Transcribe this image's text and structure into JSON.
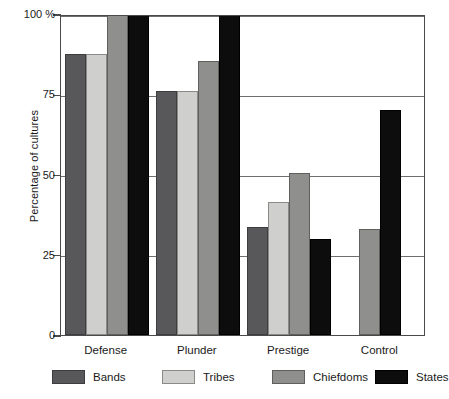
{
  "chart_data": {
    "type": "bar",
    "title": "",
    "xlabel": "",
    "ylabel": "Percentage of cultures",
    "ylim": [
      0,
      100
    ],
    "yticks": [
      0,
      25,
      50,
      75,
      100
    ],
    "ytick_labels": [
      "0",
      "25",
      "50",
      "75",
      "100 %"
    ],
    "grid": true,
    "grid_axis": "y",
    "legend_position": "bottom",
    "categories": [
      "Defense",
      "Plunder",
      "Prestige",
      "Control"
    ],
    "series": [
      {
        "name": "Bands",
        "color": "#58585a",
        "values": [
          87.5,
          76.0,
          33.5,
          null
        ]
      },
      {
        "name": "Tribes",
        "color": "#cfcfcd",
        "values": [
          87.5,
          76.0,
          41.5,
          null
        ]
      },
      {
        "name": "Chiefdoms",
        "color": "#8f8f8d",
        "values": [
          100.0,
          85.5,
          50.5,
          33.0
        ]
      },
      {
        "name": "States",
        "color": "#0d0d0d",
        "values": [
          100.0,
          100.0,
          30.0,
          70.0
        ]
      }
    ]
  },
  "legend": {
    "items": [
      {
        "label": "Bands"
      },
      {
        "label": "Tribes"
      },
      {
        "label": "Chiefdoms"
      },
      {
        "label": "States"
      }
    ]
  },
  "axis": {
    "y_title": "Percentage of cultures"
  }
}
